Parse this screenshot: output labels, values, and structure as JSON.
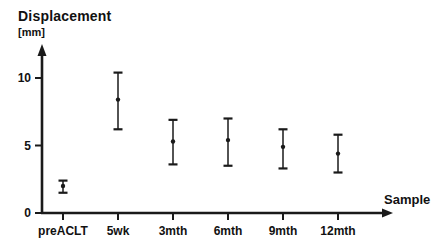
{
  "chart_data": {
    "type": "scatter",
    "subtype": "mean-with-error-bars",
    "title": "Displacement",
    "title_unit": "[mm]",
    "xlabel": "Sample",
    "ylabel": "Displacement [mm]",
    "categories": [
      "preACLT",
      "5wk",
      "3mth",
      "6mth",
      "9mth",
      "12mth"
    ],
    "series": [
      {
        "name": "Displacement",
        "means": [
          2.0,
          8.4,
          5.3,
          5.4,
          4.9,
          4.4
        ],
        "upper": [
          2.4,
          10.4,
          6.9,
          7.0,
          6.2,
          5.8
        ],
        "lower": [
          1.5,
          6.2,
          3.6,
          3.5,
          3.3,
          3.0
        ]
      }
    ],
    "yticks": [
      0,
      5,
      10
    ],
    "ytick_labels": [
      "0",
      "5",
      "10"
    ],
    "ylim": [
      0,
      11.8
    ],
    "grid": false,
    "legend": false,
    "marker_color": "#1a1a1a",
    "axis_color": "#1a1a1a"
  }
}
